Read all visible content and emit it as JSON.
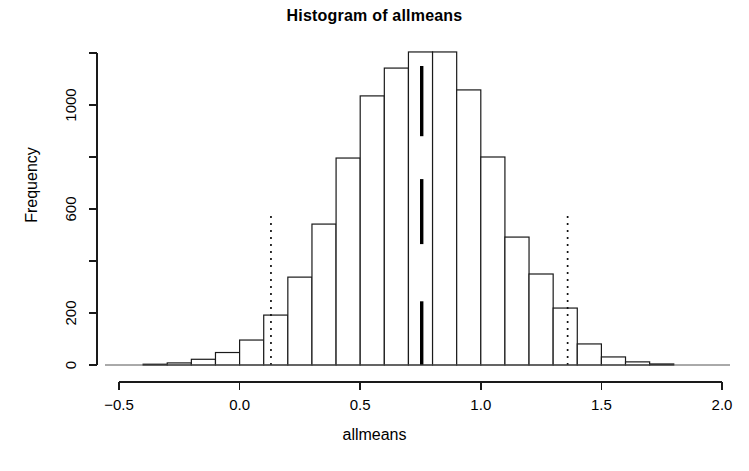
{
  "chart_data": {
    "type": "bar",
    "title": "Histogram of allmeans",
    "xlabel": "allmeans",
    "ylabel": "Frequency",
    "xlim": [
      -0.5,
      2.0
    ],
    "ylim": [
      0,
      1240
    ],
    "grid": false,
    "legend": null,
    "bin_width": 0.1,
    "x_ticks": [
      -0.5,
      0.0,
      0.5,
      1.0,
      1.5,
      2.0
    ],
    "x_tick_labels": [
      "-0.5",
      "0.0",
      "0.5",
      "1.0",
      "1.5",
      "2.0"
    ],
    "y_ticks": [
      0,
      200,
      400,
      600,
      800,
      1000,
      1200
    ],
    "y_tick_labels": [
      "0",
      "200",
      "",
      "600",
      "",
      "1000",
      ""
    ],
    "bin_starts": [
      -0.4,
      -0.3,
      -0.2,
      -0.1,
      0.0,
      0.1,
      0.2,
      0.3,
      0.4,
      0.5,
      0.6,
      0.7,
      0.8,
      0.9,
      1.0,
      1.1,
      1.2,
      1.3,
      1.4,
      1.5,
      1.6,
      1.7
    ],
    "values": [
      3,
      8,
      22,
      48,
      96,
      192,
      338,
      542,
      796,
      1035,
      1142,
      1204,
      1204,
      1058,
      800,
      492,
      350,
      219,
      81,
      31,
      12,
      4
    ],
    "annotations": [
      {
        "name": "lower-ci",
        "type": "vline",
        "x": 0.13,
        "y_top": 590,
        "style": "dotted"
      },
      {
        "name": "upper-ci",
        "type": "vline",
        "x": 1.36,
        "y_top": 590,
        "style": "dotted"
      },
      {
        "name": "mean-mark-upper",
        "type": "segment",
        "x": 0.755,
        "y0": 880,
        "y1": 1150,
        "style": "solid-thick"
      },
      {
        "name": "mean-mark-middle",
        "type": "segment",
        "x": 0.755,
        "y0": 465,
        "y1": 715,
        "style": "solid-thick"
      },
      {
        "name": "mean-mark-lower",
        "type": "segment",
        "x": 0.755,
        "y0": 0,
        "y1": 245,
        "style": "solid-thick"
      }
    ],
    "colors": {
      "bar_fill": "#ffffff",
      "bar_stroke": "#1a1a1a",
      "axis": "#1a1a1a",
      "annotation": "#000000",
      "background": "#ffffff"
    }
  }
}
